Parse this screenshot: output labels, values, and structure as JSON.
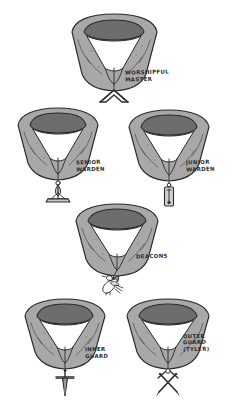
{
  "illustration": {
    "title": "Masonic Officer Collars and Jewels",
    "style": "hand-drawn pen and ink with grey wash",
    "background_color": "#ffffff",
    "ink_color": "#2b2b2b",
    "collar_fill_color": "#a8a8a8",
    "collar_inner_band_color": "#6d6d6d",
    "collar_highlight_color": "#c4c4c4"
  },
  "collars": [
    {
      "id": "worshipful-master",
      "label": "WORSHIPFUL\nMASTER",
      "jewel": "square-icon",
      "jewel_description": "carpenter's square",
      "row": 1,
      "column": "center"
    },
    {
      "id": "senior-warden",
      "label": "SENIOR\nWARDEN",
      "jewel": "level-icon",
      "jewel_description": "level",
      "row": 2,
      "column": "left"
    },
    {
      "id": "junior-warden",
      "label": "JUNIOR\nWARDEN",
      "jewel": "plumb-rule-icon",
      "jewel_description": "plumb rule",
      "row": 2,
      "column": "right"
    },
    {
      "id": "deacons",
      "label": "DEACONS",
      "jewel": "dove-icon",
      "jewel_description": "dove and olive branch",
      "row": 3,
      "column": "center"
    },
    {
      "id": "inner-guard",
      "label": "INNER\nGUARD",
      "jewel": "sword-icon",
      "jewel_description": "single sword",
      "row": 4,
      "column": "left"
    },
    {
      "id": "outer-guard",
      "label": "OUTER\nGUARD\n(TYLER)",
      "jewel": "crossed-swords-icon",
      "jewel_description": "crossed swords",
      "row": 4,
      "column": "right"
    }
  ]
}
